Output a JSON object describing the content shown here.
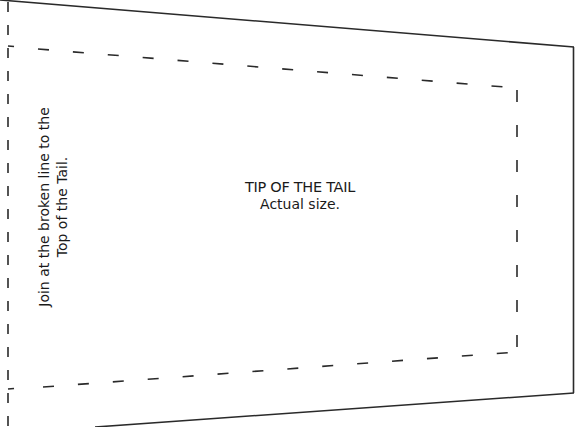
{
  "pattern": {
    "title": "TIP OF THE TAIL",
    "subtitle": "Actual size.",
    "instruction_line1": "Join at the broken line to the",
    "instruction_line2": "Top of the Tail.",
    "colors": {
      "line": "#2a2a2a",
      "background": "#ffffff",
      "text": "#1a1a1a"
    }
  }
}
